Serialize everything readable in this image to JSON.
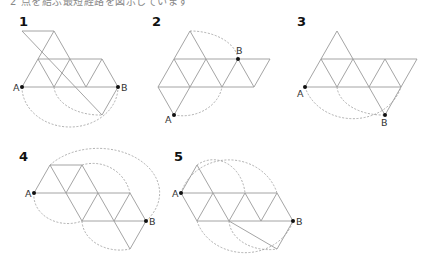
{
  "caption": "2 点を結ぶ最短経路を図示しています",
  "figures": [
    {
      "number": "1",
      "point_a": "A",
      "point_b": "B"
    },
    {
      "number": "2",
      "point_a": "A",
      "point_b": "B"
    },
    {
      "number": "3",
      "point_a": "A",
      "point_b": "B"
    },
    {
      "number": "4",
      "point_a": "A",
      "point_b": "B"
    },
    {
      "number": "5",
      "point_a": "A",
      "point_b": "B"
    }
  ],
  "colors": {
    "edge": "#9a9a9a",
    "point": "#111111",
    "text": "#111111"
  }
}
